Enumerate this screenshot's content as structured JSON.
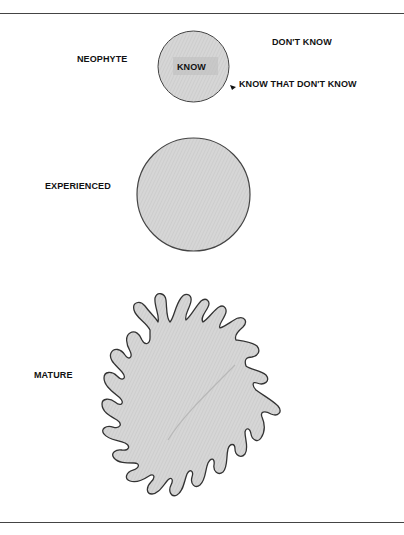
{
  "diagram": {
    "stages": [
      {
        "label": "NEOPHYTE"
      },
      {
        "label": "EXPERIENCED"
      },
      {
        "label": "MATURE"
      }
    ],
    "annotations": {
      "inside": "KNOW",
      "outside": "DON'T KNOW",
      "boundary": "KNOW THAT DON'T KNOW"
    },
    "colors": {
      "fill": "#d2d2d2",
      "stroke": "#333333",
      "rule": "#444444"
    }
  }
}
